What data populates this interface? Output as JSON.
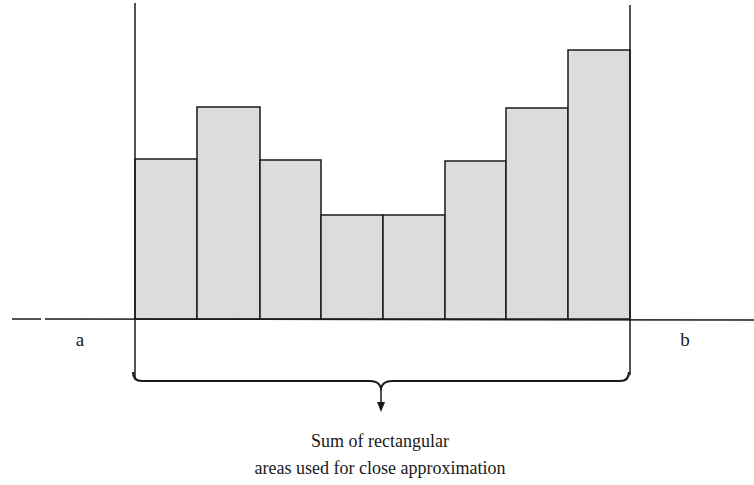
{
  "diagram": {
    "type": "riemann-sum",
    "left_label": "a",
    "right_label": "b",
    "caption_line1": "Sum of rectangular",
    "caption_line2": "areas used for close approximation",
    "bar_fill": "#dcdcdc",
    "stroke": "#1a1a1a",
    "background": "#ffffff"
  },
  "chart_data": {
    "type": "bar",
    "title": "",
    "xlabel": "",
    "ylabel": "",
    "x_edges_px": [
      135,
      197,
      260,
      321,
      383,
      445,
      506,
      568,
      630
    ],
    "bar_tops_px": [
      159,
      107,
      160,
      215,
      215,
      161,
      108,
      50
    ],
    "baseline_px": 319,
    "relative_heights": [
      160,
      212,
      159,
      104,
      104,
      158,
      211,
      269
    ],
    "interval": [
      "a",
      "b"
    ],
    "grid": false,
    "legend": null
  }
}
